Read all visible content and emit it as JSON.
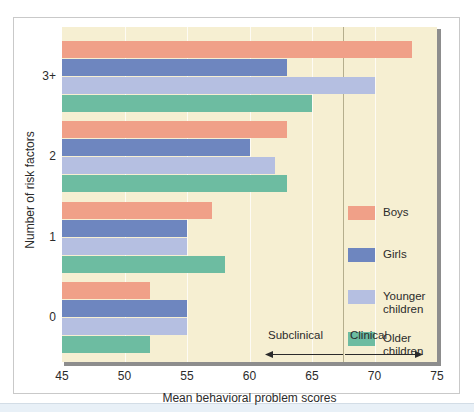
{
  "chart_data": {
    "type": "bar",
    "orientation": "horizontal",
    "title": "",
    "xlabel": "Mean behavioral problem scores",
    "ylabel": "Number of risk factors",
    "categories": [
      "0",
      "1",
      "2",
      "3+"
    ],
    "categories_top_to_bottom": [
      "3+",
      "2",
      "1",
      "0"
    ],
    "xlim": [
      45,
      75
    ],
    "xticks": [
      45,
      50,
      55,
      60,
      65,
      70,
      75
    ],
    "grid": true,
    "legend_position": "middle-right",
    "series": [
      {
        "name": "Boys",
        "color": "#f0a088",
        "values": [
          52,
          57,
          63,
          73
        ]
      },
      {
        "name": "Girls",
        "color": "#6e86bf",
        "values": [
          55,
          55,
          60,
          63
        ]
      },
      {
        "name": "Younger children",
        "color": "#b5bfe1",
        "values": [
          55,
          55,
          62,
          70
        ]
      },
      {
        "name": "Older children",
        "color": "#6dbca1",
        "values": [
          52,
          58,
          63,
          65
        ]
      }
    ],
    "annotations": [
      {
        "name": "subclinical",
        "label": "Subclinical",
        "direction": "left",
        "boundary": 67.5
      },
      {
        "name": "clinical",
        "label": "Clinical",
        "direction": "right",
        "boundary": 67.5
      }
    ],
    "divider_value": 67.5,
    "plot_background": "#f6efd2"
  },
  "axis": {
    "x_tick_labels": [
      "45",
      "50",
      "55",
      "60",
      "65",
      "70",
      "75"
    ],
    "x_title": "Mean behavioral problem scores",
    "y_tick_labels": [
      "3+",
      "2",
      "1",
      "0"
    ],
    "y_title": "Number of risk factors"
  },
  "legend": {
    "items": [
      {
        "label": "Boys",
        "color": "#f0a088"
      },
      {
        "label": "Girls",
        "color": "#6e86bf"
      },
      {
        "label": "Younger\nchildren",
        "color": "#b5bfe1"
      },
      {
        "label": "Older\nchildren",
        "color": "#6dbca1"
      }
    ]
  },
  "annotations": {
    "subclinical": "Subclinical",
    "clinical": "Clinical"
  }
}
